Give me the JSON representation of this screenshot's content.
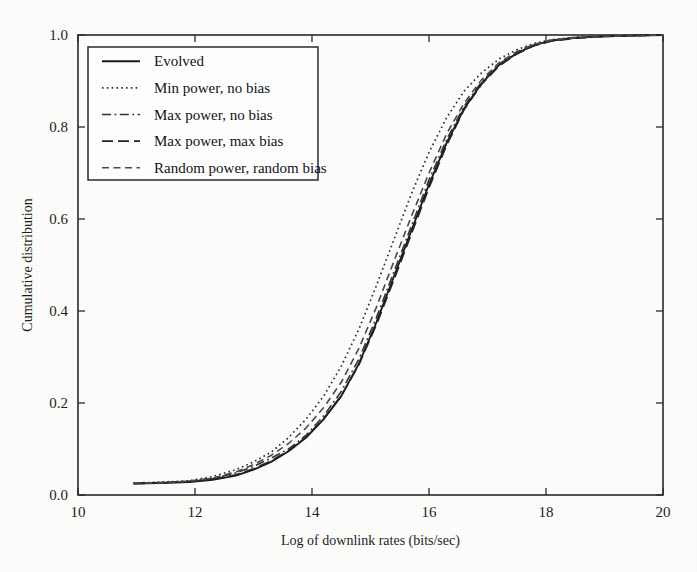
{
  "chart_data": {
    "type": "line",
    "title": "",
    "xlabel": "Log of downlink rates (bits/sec)",
    "ylabel": "Cumulative distribution",
    "xlim": [
      10,
      20
    ],
    "ylim": [
      0.0,
      1.0
    ],
    "xticks": [
      "10",
      "12",
      "14",
      "16",
      "18",
      "20"
    ],
    "xtick_values": [
      10,
      12,
      14,
      16,
      18,
      20
    ],
    "yticks": [
      "0.0",
      "0.2",
      "0.4",
      "0.6",
      "0.8",
      "1.0"
    ],
    "ytick_values": [
      0.0,
      0.2,
      0.4,
      0.6,
      0.8,
      1.0
    ],
    "grid": false,
    "legend_position": "upper left",
    "series": [
      {
        "name": "Evolved",
        "style": "solid",
        "color": "#1a1a1a",
        "x": [
          10.95,
          11.4,
          11.9,
          12.3,
          12.7,
          13.0,
          13.3,
          13.6,
          13.9,
          14.2,
          14.5,
          14.8,
          15.1,
          15.4,
          15.7,
          16.0,
          16.3,
          16.6,
          16.9,
          17.2,
          17.5,
          17.8,
          18.1,
          18.5,
          19.0,
          19.6,
          20.0
        ],
        "y": [
          0.025,
          0.026,
          0.028,
          0.033,
          0.042,
          0.055,
          0.072,
          0.095,
          0.125,
          0.165,
          0.215,
          0.285,
          0.375,
          0.475,
          0.575,
          0.675,
          0.765,
          0.84,
          0.895,
          0.935,
          0.96,
          0.978,
          0.988,
          0.994,
          0.997,
          0.999,
          1.0
        ]
      },
      {
        "name": "Min power, no bias",
        "style": "dotted",
        "color": "#2d2d2d",
        "x": [
          10.95,
          11.4,
          11.9,
          12.3,
          12.7,
          13.0,
          13.3,
          13.6,
          13.9,
          14.2,
          14.5,
          14.8,
          15.1,
          15.4,
          15.7,
          16.0,
          16.3,
          16.6,
          16.9,
          17.2,
          17.5,
          17.8,
          18.1,
          18.5,
          19.0,
          19.6,
          20.0
        ],
        "y": [
          0.026,
          0.028,
          0.031,
          0.04,
          0.055,
          0.072,
          0.093,
          0.125,
          0.165,
          0.215,
          0.28,
          0.36,
          0.455,
          0.555,
          0.655,
          0.745,
          0.82,
          0.878,
          0.918,
          0.948,
          0.968,
          0.982,
          0.99,
          0.995,
          0.998,
          0.999,
          1.0
        ]
      },
      {
        "name": "Max power, no bias",
        "style": "dashdot",
        "color": "#333333",
        "x": [
          10.95,
          11.4,
          11.9,
          12.3,
          12.7,
          13.0,
          13.3,
          13.6,
          13.9,
          14.2,
          14.5,
          14.8,
          15.1,
          15.4,
          15.7,
          16.0,
          16.3,
          16.6,
          16.9,
          17.2,
          17.5,
          17.8,
          18.1,
          18.5,
          19.0,
          19.6,
          20.0
        ],
        "y": [
          0.025,
          0.027,
          0.03,
          0.036,
          0.048,
          0.062,
          0.08,
          0.1,
          0.13,
          0.172,
          0.225,
          0.295,
          0.385,
          0.485,
          0.585,
          0.685,
          0.772,
          0.845,
          0.898,
          0.937,
          0.962,
          0.979,
          0.988,
          0.994,
          0.997,
          0.999,
          1.0
        ]
      },
      {
        "name": "Max power, max bias",
        "style": "dashed-long",
        "color": "#242424",
        "x": [
          10.95,
          11.4,
          11.9,
          12.3,
          12.7,
          13.0,
          13.3,
          13.6,
          13.9,
          14.2,
          14.5,
          14.8,
          15.1,
          15.4,
          15.7,
          16.0,
          16.3,
          16.6,
          16.9,
          17.2,
          17.5,
          17.8,
          18.1,
          18.5,
          19.0,
          19.6,
          20.0
        ],
        "y": [
          0.025,
          0.026,
          0.029,
          0.034,
          0.044,
          0.057,
          0.074,
          0.096,
          0.126,
          0.166,
          0.216,
          0.283,
          0.37,
          0.468,
          0.568,
          0.668,
          0.76,
          0.838,
          0.893,
          0.933,
          0.959,
          0.977,
          0.987,
          0.993,
          0.997,
          0.999,
          1.0
        ]
      },
      {
        "name": "Random power, random bias",
        "style": "dashed-med",
        "color": "#4a4a4a",
        "x": [
          10.95,
          11.4,
          11.9,
          12.3,
          12.7,
          13.0,
          13.3,
          13.6,
          13.9,
          14.2,
          14.5,
          14.8,
          15.1,
          15.4,
          15.7,
          16.0,
          16.3,
          16.6,
          16.9,
          17.2,
          17.5,
          17.8,
          18.1,
          18.5,
          19.0,
          19.6,
          20.0
        ],
        "y": [
          0.025,
          0.027,
          0.03,
          0.037,
          0.05,
          0.066,
          0.086,
          0.112,
          0.146,
          0.19,
          0.245,
          0.318,
          0.408,
          0.508,
          0.606,
          0.7,
          0.785,
          0.852,
          0.903,
          0.94,
          0.964,
          0.98,
          0.989,
          0.994,
          0.997,
          0.999,
          1.0
        ]
      }
    ]
  },
  "legend": {
    "entries": [
      {
        "label": "Evolved"
      },
      {
        "label": "Min power, no bias"
      },
      {
        "label": "Max power, no bias"
      },
      {
        "label": "Max power, max bias"
      },
      {
        "label": "Random power, random bias"
      }
    ]
  }
}
